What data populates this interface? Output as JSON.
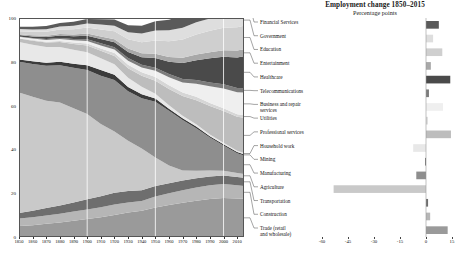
{
  "title": "Employment change 1850–2015",
  "subtitle": "Percentage points",
  "chart_data": [
    {
      "type": "area",
      "title": "Employment change 1850–2015",
      "subtitle": "Percentage points",
      "xlabel": "",
      "ylabel": "",
      "ylim": [
        0,
        100
      ],
      "xlim": [
        1850,
        2015
      ],
      "grid": "vertical-white-1900-1950-2000",
      "stacked": true,
      "x": [
        1850,
        1860,
        1870,
        1880,
        1890,
        1900,
        1910,
        1920,
        1930,
        1940,
        1950,
        1960,
        1970,
        1980,
        1990,
        2000,
        2010,
        2015
      ],
      "xticks": [
        "1850",
        "1860",
        "1870",
        "1880",
        "1890",
        "1900",
        "1910",
        "1920",
        "1930",
        "1940",
        "1950",
        "1960",
        "1970",
        "1980",
        "1990",
        "2000",
        "2010"
      ],
      "yticks": [
        "0",
        "20",
        "40",
        "60",
        "80",
        "100"
      ],
      "series": [
        {
          "name": "Trade (retail and wholesale)",
          "color": "#9a9a9a",
          "values": [
            5.0,
            5.4,
            6.0,
            6.6,
            7.4,
            8.2,
            9.0,
            10.0,
            11.2,
            12.0,
            13.5,
            14.6,
            15.6,
            16.6,
            17.4,
            17.8,
            17.6,
            17.5
          ]
        },
        {
          "name": "Construction",
          "color": "#b6b6b6",
          "values": [
            3.4,
            3.6,
            3.8,
            4.0,
            4.2,
            4.4,
            4.6,
            4.8,
            4.6,
            4.4,
            5.0,
            5.4,
            5.8,
            6.0,
            6.2,
            6.4,
            6.0,
            5.8
          ]
        },
        {
          "name": "Transportation",
          "color": "#6e6e6e",
          "values": [
            2.6,
            3.0,
            3.4,
            3.8,
            4.2,
            4.6,
            5.0,
            5.4,
            5.2,
            5.0,
            4.8,
            4.6,
            4.4,
            4.2,
            4.0,
            3.9,
            3.8,
            3.8
          ]
        },
        {
          "name": "Agriculture",
          "color": "#c9c9c9",
          "values": [
            55.0,
            52.0,
            49.0,
            47.0,
            43.0,
            39.0,
            33.0,
            28.0,
            23.0,
            19.0,
            13.0,
            8.0,
            4.6,
            3.4,
            2.8,
            2.2,
            1.8,
            1.7
          ]
        },
        {
          "name": "Manufacturing",
          "color": "#8e8e8e",
          "values": [
            14.0,
            15.0,
            16.0,
            17.0,
            18.5,
            20.0,
            22.0,
            23.5,
            22.5,
            23.0,
            25.5,
            25.0,
            23.0,
            19.5,
            15.0,
            11.5,
            9.0,
            8.4
          ]
        },
        {
          "name": "Mining",
          "color": "#3b3b3b",
          "values": [
            1.0,
            1.2,
            1.4,
            1.6,
            1.8,
            2.2,
            2.6,
            2.4,
            2.0,
            1.8,
            1.4,
            1.0,
            0.8,
            0.8,
            0.6,
            0.5,
            0.6,
            0.6
          ]
        },
        {
          "name": "Household work",
          "color": "#e8e8e8",
          "values": [
            8.0,
            7.6,
            7.2,
            6.8,
            6.4,
            6.0,
            5.4,
            4.8,
            4.2,
            3.4,
            2.2,
            1.6,
            1.2,
            1.0,
            0.8,
            0.7,
            0.6,
            0.6
          ]
        },
        {
          "name": "Professional services",
          "color": "#bdbdbd",
          "values": [
            1.6,
            1.8,
            2.0,
            2.2,
            2.6,
            3.0,
            3.4,
            3.8,
            4.4,
            5.0,
            6.0,
            7.4,
            9.0,
            11.0,
            13.0,
            14.5,
            15.5,
            16.0
          ]
        },
        {
          "name": "Utilities",
          "color": "#d6d6d6",
          "values": [
            0.2,
            0.3,
            0.4,
            0.5,
            0.7,
            0.9,
            1.1,
            1.3,
            1.5,
            1.6,
            1.7,
            1.7,
            1.6,
            1.5,
            1.4,
            1.3,
            1.2,
            1.2
          ]
        },
        {
          "name": "Business and repair services",
          "color": "#efefef",
          "values": [
            0.6,
            0.7,
            0.8,
            0.9,
            1.0,
            1.2,
            1.4,
            1.6,
            1.9,
            2.2,
            2.8,
            3.6,
            4.6,
            6.0,
            7.6,
            9.0,
            10.0,
            10.4
          ]
        },
        {
          "name": "Telecommunications",
          "color": "#7c7c7c",
          "values": [
            0.2,
            0.3,
            0.4,
            0.5,
            0.6,
            0.8,
            1.0,
            1.1,
            1.2,
            1.3,
            1.4,
            1.5,
            1.6,
            1.7,
            1.8,
            1.9,
            1.9,
            1.9
          ]
        },
        {
          "name": "Healthcare",
          "color": "#4a4a4a",
          "values": [
            0.6,
            0.7,
            0.9,
            1.1,
            1.3,
            1.6,
            1.9,
            2.2,
            2.8,
            3.4,
            4.4,
            5.6,
            7.2,
            9.0,
            11.0,
            12.6,
            14.0,
            14.6
          ]
        },
        {
          "name": "Entertainment",
          "color": "#a8a8a8",
          "values": [
            0.4,
            0.5,
            0.6,
            0.7,
            0.8,
            1.0,
            1.2,
            1.4,
            1.6,
            1.8,
            2.0,
            2.2,
            2.4,
            2.6,
            2.8,
            3.0,
            3.2,
            3.2
          ]
        },
        {
          "name": "Education",
          "color": "#cfcfcf",
          "values": [
            1.4,
            1.6,
            1.8,
            2.0,
            2.4,
            2.8,
            3.2,
            3.6,
            4.2,
            5.0,
            6.0,
            7.2,
            8.4,
            9.2,
            9.8,
            10.2,
            10.6,
            10.8
          ]
        },
        {
          "name": "Government",
          "color": "#dedede",
          "values": [
            1.0,
            1.1,
            1.2,
            1.4,
            1.6,
            1.8,
            2.2,
            2.6,
            3.2,
            4.0,
            4.6,
            5.0,
            5.4,
            5.6,
            5.6,
            5.4,
            5.2,
            5.1
          ]
        },
        {
          "name": "Financial Services",
          "color": "#5a5a5a",
          "values": [
            1.0,
            1.2,
            1.4,
            1.6,
            1.8,
            2.1,
            2.4,
            2.8,
            3.2,
            3.6,
            4.2,
            4.8,
            5.6,
            6.4,
            7.2,
            7.8,
            8.2,
            8.4
          ]
        }
      ]
    },
    {
      "type": "bar",
      "orientation": "horizontal",
      "title": "",
      "xlabel": "Percentage points",
      "ylabel": "",
      "xlim": [
        -60,
        15
      ],
      "xticks": [
        "-60",
        "-45",
        "-30",
        "-15",
        "0",
        "15"
      ],
      "xtick_values": [
        -60,
        -45,
        -30,
        -15,
        0,
        15
      ],
      "grid": false,
      "categories": [
        "Financial Services",
        "Government",
        "Education",
        "Entertainment",
        "Healthcare",
        "Telecommunications",
        "Business and repair services",
        "Utilities",
        "Professional services",
        "Household work",
        "Mining",
        "Manufacturing",
        "Agriculture",
        "Transportation",
        "Construction",
        "Trade (retail and wholesale)"
      ],
      "values": [
        7.4,
        4.1,
        9.4,
        2.8,
        14.0,
        1.7,
        9.8,
        1.0,
        14.4,
        -7.4,
        -0.4,
        -5.6,
        -53.3,
        1.2,
        2.4,
        12.5
      ],
      "colors": [
        "#5a5a5a",
        "#dedede",
        "#cfcfcf",
        "#a8a8a8",
        "#4a4a4a",
        "#7c7c7c",
        "#efefef",
        "#d6d6d6",
        "#bdbdbd",
        "#e8e8e8",
        "#3b3b3b",
        "#8e8e8e",
        "#c9c9c9",
        "#6e6e6e",
        "#b6b6b6",
        "#9a9a9a"
      ]
    }
  ],
  "legend": {
    "items": [
      {
        "label": "Financial Services"
      },
      {
        "label": "Government"
      },
      {
        "label": "Education"
      },
      {
        "label": "Entertainment"
      },
      {
        "label": "Healthcare"
      },
      {
        "label": "Telecommunications"
      },
      {
        "label": "Business and repair\nservices"
      },
      {
        "label": "Utilities"
      },
      {
        "label": "Professional services"
      },
      {
        "label": "Household work"
      },
      {
        "label": "Mining"
      },
      {
        "label": "Manufacturing"
      },
      {
        "label": "Agriculture"
      },
      {
        "label": "Transportation"
      },
      {
        "label": "Construction"
      },
      {
        "label": "Trade (retail\nand wholesale)"
      }
    ]
  }
}
